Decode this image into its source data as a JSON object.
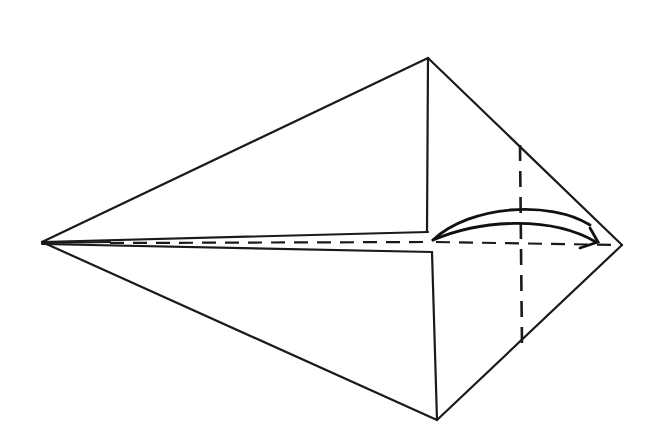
{
  "diagram": {
    "type": "origami-fold-step",
    "colors": {
      "ink": "#1a1a1a",
      "paper": "#ffffff"
    },
    "points": {
      "left_tip": [
        42,
        242
      ],
      "top": [
        428,
        58
      ],
      "bottom": [
        437,
        420
      ],
      "right_tip": [
        622,
        245
      ],
      "center_top": [
        428,
        230
      ],
      "center_bottom": [
        432,
        252
      ]
    },
    "lines": {
      "valley_fold_x": 520,
      "horizontal_dashed_y": 242
    },
    "arrow": {
      "from": [
        433,
        240
      ],
      "to": [
        598,
        243
      ],
      "kind": "fold-over"
    },
    "labels": []
  }
}
